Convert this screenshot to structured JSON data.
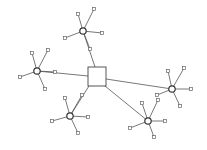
{
  "diagram": {
    "type": "network-graph",
    "colors": {
      "background": "#ffffff",
      "edge": "#555555",
      "node_stroke": "#333333"
    },
    "center": {
      "id": "center",
      "shape": "square",
      "x": 88,
      "y": 67,
      "w": 18,
      "h": 19
    },
    "hubs": [
      {
        "id": "hub-top",
        "x": 83,
        "y": 31,
        "r": 3.2,
        "leaves": [
          [
            78,
            14
          ],
          [
            94,
            9
          ],
          [
            102,
            33
          ],
          [
            65,
            38
          ],
          [
            90,
            49
          ]
        ]
      },
      {
        "id": "hub-left",
        "x": 37,
        "y": 71,
        "r": 3.2,
        "leaves": [
          [
            32,
            53
          ],
          [
            48,
            50
          ],
          [
            20,
            77
          ],
          [
            45,
            89
          ],
          [
            55,
            72
          ]
        ]
      },
      {
        "id": "hub-right",
        "x": 172,
        "y": 89,
        "r": 3.2,
        "leaves": [
          [
            168,
            71
          ],
          [
            184,
            68
          ],
          [
            191,
            89
          ],
          [
            180,
            106
          ],
          [
            157,
            95
          ]
        ]
      },
      {
        "id": "hub-bottom-left",
        "x": 70,
        "y": 116,
        "r": 3.2,
        "leaves": [
          [
            65,
            98
          ],
          [
            82,
            95
          ],
          [
            88,
            117
          ],
          [
            52,
            121
          ],
          [
            78,
            133
          ]
        ]
      },
      {
        "id": "hub-bottom-right",
        "x": 148,
        "y": 121,
        "r": 3.2,
        "leaves": [
          [
            142,
            103
          ],
          [
            158,
            100
          ],
          [
            165,
            121
          ],
          [
            130,
            128
          ],
          [
            154,
            137
          ]
        ]
      }
    ],
    "center_edges": [
      {
        "from": "center",
        "to": "hub-top",
        "from_xy": [
          95,
          67
        ]
      },
      {
        "from": "center",
        "to": "hub-left",
        "from_xy": [
          88,
          76
        ]
      },
      {
        "from": "center",
        "to": "hub-right",
        "from_xy": [
          106,
          79
        ]
      },
      {
        "from": "center",
        "to": "hub-bottom-left",
        "from_xy": [
          89,
          86
        ]
      },
      {
        "from": "center",
        "to": "hub-bottom-right",
        "from_xy": [
          105,
          86
        ]
      }
    ],
    "leaf_size": 3
  }
}
